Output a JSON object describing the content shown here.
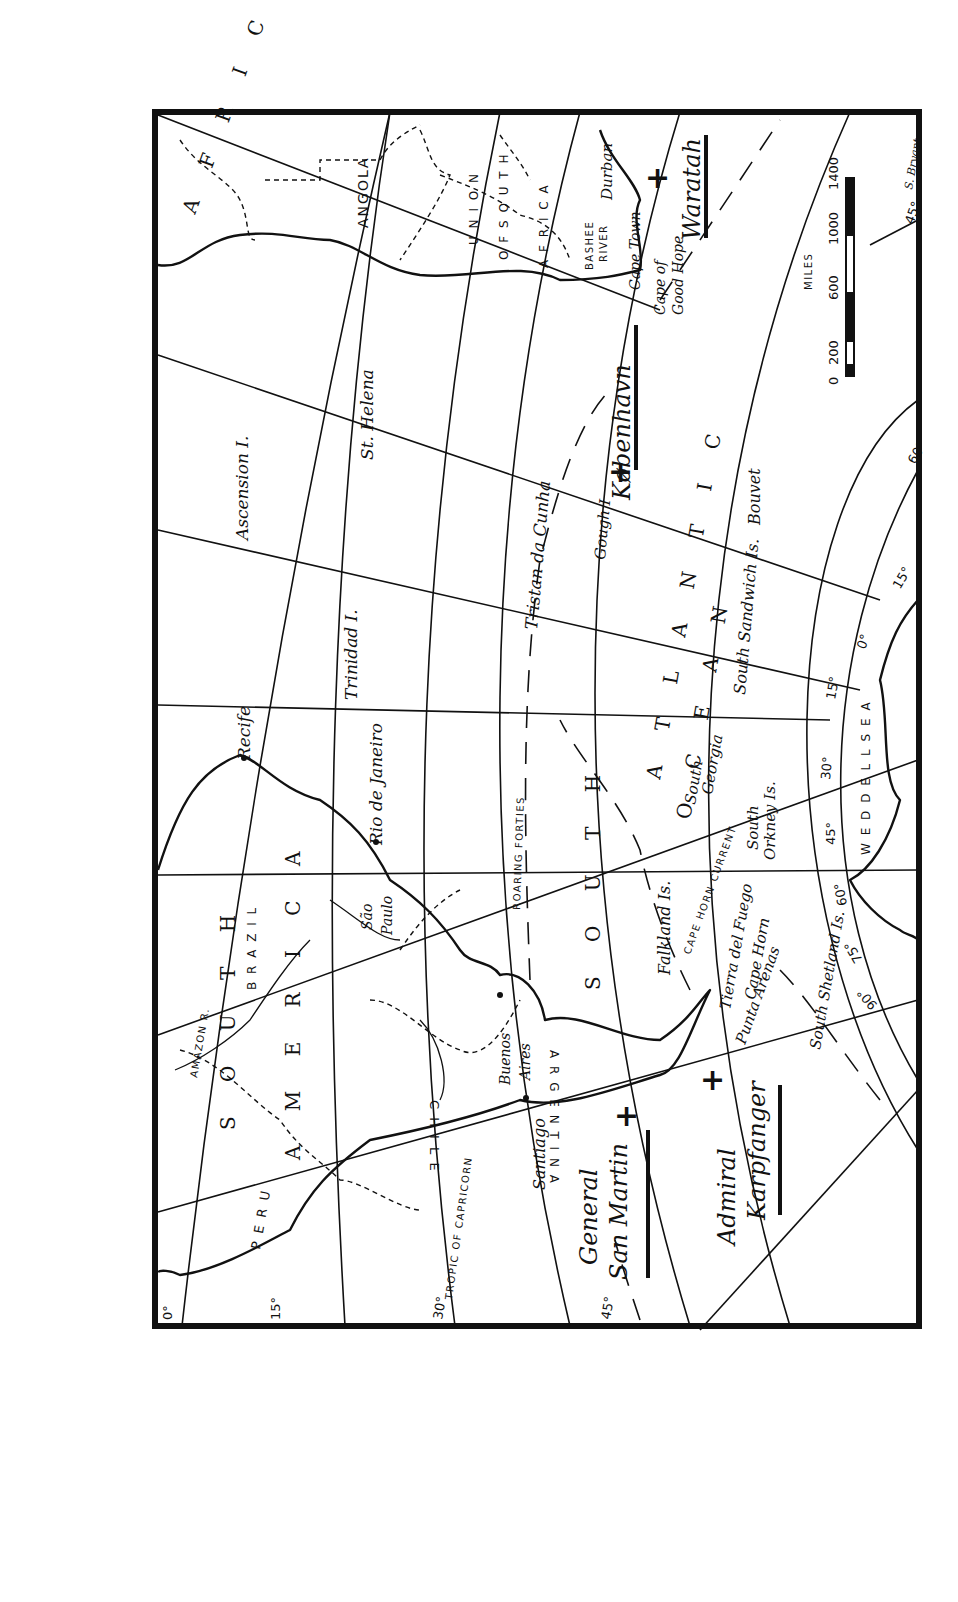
{
  "map": {
    "orientation": "rotated-90-clockwise",
    "regions": {
      "africa": "A F R I C A",
      "angola": "ANGOLA",
      "union_south_africa_1": "U N I O N",
      "union_south_africa_2": "O F  S O U T H",
      "union_south_africa_3": "A F R I C A",
      "south_america_1": "S O U T H",
      "south_america_2": "A M E R I C A",
      "brazil": "B R A Z I L",
      "peru": "P E R U",
      "chile": "C H I L E",
      "argentina": "A R G E N T I N A",
      "south_atlantic_1": "S O U T H",
      "south_atlantic_2": "A T L A N T I C",
      "ocean": "O C E A N",
      "weddell_sea": "W E D D E L L  S E A"
    },
    "places": {
      "recife": "Recife",
      "rio": "Rio de Janeiro",
      "sao_paulo_1": "São",
      "sao_paulo_2": "Paulo",
      "buenos_aires_1": "Buenos",
      "buenos_aires_2": "Aires",
      "santiago": "Santiago",
      "punta_arenas": "Punta Arenas",
      "cape_horn": "Cape Horn",
      "tierra_del_fuego": "Tierra del Fuego",
      "falkland": "Falkland Is.",
      "south_georgia_1": "South",
      "south_georgia_2": "Georgia",
      "south_orkney_1": "South",
      "south_orkney_2": "Orkney Is.",
      "south_shetland": "South Shetland Is.",
      "south_sandwich": "South Sandwich Is.",
      "bouvet": "Bouvet",
      "gough": "Gough I",
      "tristan": "Tristan da Cunha",
      "trinidad": "Trinidad I.",
      "ascension": "Ascension I.",
      "st_helena": "St. Helena",
      "cape_town": "Cape Town",
      "durban": "Durban",
      "cape_good_hope_1": "Cape of",
      "cape_good_hope_2": "Good Hope",
      "bashee_1": "BASHEE",
      "bashee_2": "RIVER",
      "amazon": "AMAZON R."
    },
    "features": {
      "tropic": "TROPIC OF CAPRICORN",
      "roaring_forties": "ROARING FORTIES",
      "cape_horn_current": "CAPE HORN CURRENT"
    },
    "ships": [
      {
        "name": "København",
        "marker": "+"
      },
      {
        "name": "Waratah",
        "marker": "+"
      },
      {
        "name_line1": "General",
        "name_line2": "San Martin",
        "marker": "+"
      },
      {
        "name_line1": "Admiral",
        "name_line2": "Karpfanger",
        "marker": "+"
      }
    ],
    "degree_labels": {
      "lat_0": "0°",
      "lat_15": "15°",
      "lat_30": "30°",
      "lat_45_bottom": "45°",
      "lat_45_top": "45°",
      "lat_60": "60°",
      "lon_15w": "15°",
      "lon_0": "0°",
      "lon_15e": "15°",
      "lon_30": "30°",
      "lon_45": "45°",
      "lon_60": "60°",
      "lon_75": "75°",
      "lon_90": "90°"
    },
    "scale_bar": {
      "unit": "MILES",
      "ticks": [
        "0",
        "200",
        "600",
        "1000",
        "1400"
      ]
    },
    "credit": "S. Bryant"
  }
}
